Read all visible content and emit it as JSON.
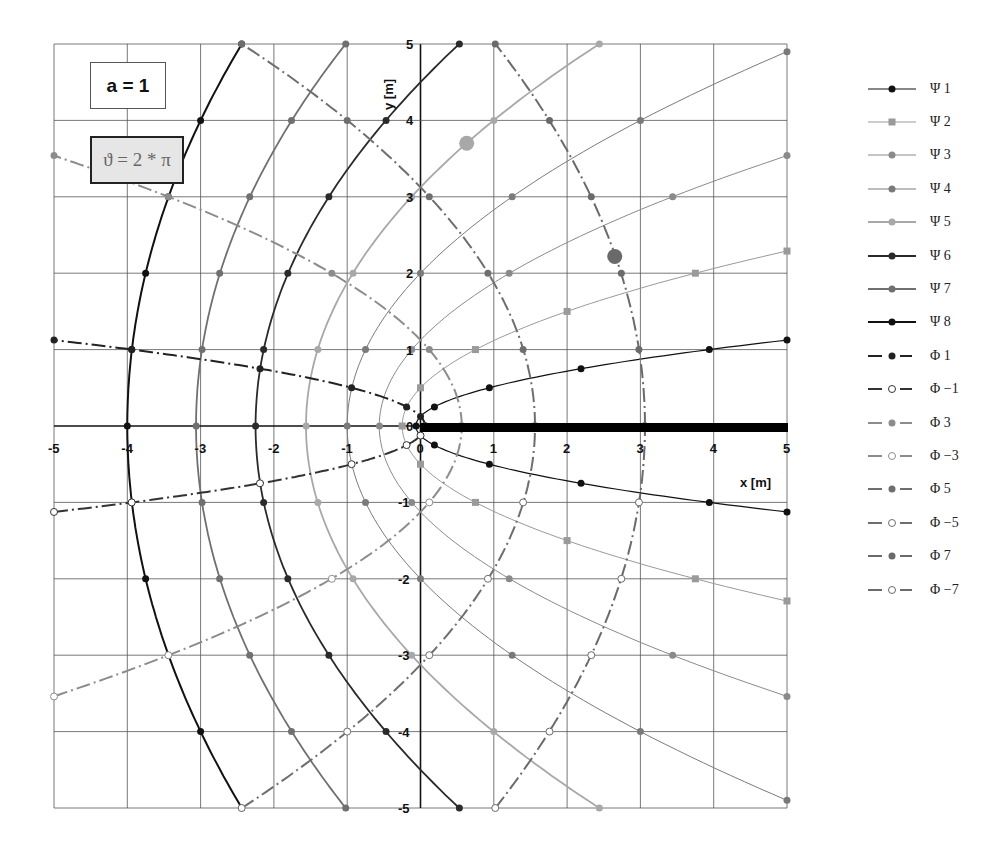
{
  "annotations": {
    "a_label": "a = 1",
    "theta_label": "ϑ = 2 * π"
  },
  "axes": {
    "xlabel": "x [m]",
    "ylabel": "y [m]",
    "x_ticks": [
      "-5",
      "-4",
      "-3",
      "-2",
      "-1",
      "0",
      "1",
      "2",
      "3",
      "4",
      "5"
    ],
    "y_ticks": [
      "5",
      "4",
      "3",
      "2",
      "1",
      "0",
      "-1",
      "-2",
      "-3",
      "-4",
      "-5"
    ]
  },
  "legend": [
    {
      "label": "Ψ 1",
      "color": "#111111",
      "marker": "dot",
      "dash": "solid",
      "width": 1.2
    },
    {
      "label": "Ψ 2",
      "color": "#9a9a9a",
      "marker": "square",
      "dash": "solid",
      "width": 1
    },
    {
      "label": "Ψ 3",
      "color": "#8a8a8a",
      "marker": "dot",
      "dash": "solid",
      "width": 1
    },
    {
      "label": "Ψ 4",
      "color": "#7a7a7a",
      "marker": "dot",
      "dash": "solid",
      "width": 1
    },
    {
      "label": "Ψ 5",
      "color": "#a8a8a8",
      "marker": "dot",
      "dash": "solid",
      "width": 1.8
    },
    {
      "label": "Ψ 6",
      "color": "#2a2a2a",
      "marker": "dot",
      "dash": "solid",
      "width": 1.8
    },
    {
      "label": "Ψ 7",
      "color": "#707070",
      "marker": "dot",
      "dash": "solid",
      "width": 1.8
    },
    {
      "label": "Ψ 8",
      "color": "#111111",
      "marker": "dot",
      "dash": "solid",
      "width": 2
    },
    {
      "label": "Φ 1",
      "color": "#222222",
      "marker": "dot",
      "dash": "dashdot",
      "width": 2
    },
    {
      "label": "Φ −1",
      "color": "#333333",
      "marker": "open",
      "dash": "dashdot",
      "width": 2
    },
    {
      "label": "Φ 3",
      "color": "#8c8c8c",
      "marker": "dot",
      "dash": "dashdot",
      "width": 2
    },
    {
      "label": "Φ −3",
      "color": "#8c8c8c",
      "marker": "open",
      "dash": "dashdot",
      "width": 2
    },
    {
      "label": "Φ 5",
      "color": "#6e6e6e",
      "marker": "dot",
      "dash": "dashdot",
      "width": 2
    },
    {
      "label": "Φ −5",
      "color": "#6e6e6e",
      "marker": "open",
      "dash": "dashdot",
      "width": 2
    },
    {
      "label": "Φ 7",
      "color": "#6a6a6a",
      "marker": "dot",
      "dash": "dashdot",
      "width": 2
    },
    {
      "label": "Φ −7",
      "color": "#6a6a6a",
      "marker": "open",
      "dash": "dashdot",
      "width": 2
    }
  ],
  "chart_data": {
    "type": "line",
    "title": "",
    "xlabel": "x [m]",
    "ylabel": "y [m]",
    "xlim": [
      -5,
      5
    ],
    "ylim": [
      -5,
      5
    ],
    "grid": true,
    "legend_position": "right",
    "annotations": [
      "a = 1",
      "ϑ = 2 * π"
    ],
    "plate": {
      "from": [
        0,
        0
      ],
      "to": [
        5,
        0
      ],
      "note": "thick black segment along positive x-axis"
    },
    "series": [
      {
        "name": "Ψ 1",
        "points": [
          [
            5,
            -1.125
          ],
          [
            3.94,
            -1
          ],
          [
            2.19,
            -0.75
          ],
          [
            0.94,
            -0.5
          ],
          [
            0.19,
            -0.25
          ],
          [
            -0.06,
            0
          ],
          [
            0.19,
            0.25
          ],
          [
            0.94,
            0.5
          ],
          [
            2.19,
            0.75
          ],
          [
            3.94,
            1
          ],
          [
            5,
            1.125
          ]
        ]
      },
      {
        "name": "Ψ 2",
        "points": [
          [
            5,
            -2.29
          ],
          [
            3.75,
            -2
          ],
          [
            2,
            -1.5
          ],
          [
            0.75,
            -1
          ],
          [
            0,
            -0.5
          ],
          [
            -0.25,
            0
          ],
          [
            0,
            0.5
          ],
          [
            0.75,
            1
          ],
          [
            2,
            1.5
          ],
          [
            3.75,
            2
          ],
          [
            5,
            2.29
          ]
        ]
      },
      {
        "name": "Ψ 3",
        "points": [
          [
            5,
            -3.54
          ],
          [
            3.44,
            -3
          ],
          [
            1.21,
            -2
          ],
          [
            -0.12,
            -1
          ],
          [
            -0.56,
            0
          ],
          [
            -0.12,
            1
          ],
          [
            1.21,
            2
          ],
          [
            3.44,
            3
          ],
          [
            5,
            3.54
          ]
        ]
      },
      {
        "name": "Ψ 4",
        "points": [
          [
            5,
            -4.9
          ],
          [
            3,
            -4
          ],
          [
            1.25,
            -3
          ],
          [
            0,
            -2
          ],
          [
            -0.75,
            -1
          ],
          [
            -1,
            0
          ],
          [
            -0.75,
            1
          ],
          [
            0,
            2
          ],
          [
            1.25,
            3
          ],
          [
            3,
            4
          ],
          [
            5,
            4.9
          ]
        ]
      },
      {
        "name": "Ψ 5",
        "points": [
          [
            2.44,
            -5
          ],
          [
            1,
            -4
          ],
          [
            -0.12,
            -3
          ],
          [
            -0.92,
            -2
          ],
          [
            -1.4,
            -1
          ],
          [
            -1.56,
            0
          ],
          [
            -1.4,
            1
          ],
          [
            -0.92,
            2
          ],
          [
            -0.12,
            3
          ],
          [
            1,
            4
          ],
          [
            2.44,
            5
          ]
        ]
      },
      {
        "name": "Ψ 6",
        "points": [
          [
            0.53,
            -5
          ],
          [
            -0.47,
            -4
          ],
          [
            -1.25,
            -3
          ],
          [
            -1.81,
            -2
          ],
          [
            -2.14,
            -1
          ],
          [
            -2.25,
            0
          ],
          [
            -2.14,
            1
          ],
          [
            -1.81,
            2
          ],
          [
            -1.25,
            3
          ],
          [
            -0.47,
            4
          ],
          [
            0.53,
            5
          ]
        ]
      },
      {
        "name": "Ψ 7",
        "points": [
          [
            -1.02,
            -5
          ],
          [
            -1.76,
            -4
          ],
          [
            -2.33,
            -3
          ],
          [
            -2.74,
            -2
          ],
          [
            -2.98,
            -1
          ],
          [
            -3.06,
            0
          ],
          [
            -2.98,
            1
          ],
          [
            -2.74,
            2
          ],
          [
            -2.33,
            3
          ],
          [
            -1.76,
            4
          ],
          [
            -1.02,
            5
          ]
        ]
      },
      {
        "name": "Ψ 8",
        "points": [
          [
            -2.44,
            -5
          ],
          [
            -3,
            -4
          ],
          [
            -3.44,
            -3
          ],
          [
            -3.75,
            -2
          ],
          [
            -3.94,
            -1
          ],
          [
            -4,
            0
          ],
          [
            -3.94,
            1
          ],
          [
            -3.75,
            2
          ],
          [
            -3.44,
            3
          ],
          [
            -3,
            4
          ],
          [
            -2.44,
            5
          ]
        ]
      },
      {
        "name": "Φ 1",
        "points": [
          [
            0.06,
            0
          ],
          [
            0.0,
            0.125
          ],
          [
            -0.19,
            0.25
          ],
          [
            -0.94,
            0.5
          ],
          [
            -2.19,
            0.75
          ],
          [
            -3.94,
            1
          ],
          [
            -5,
            1.125
          ]
        ]
      },
      {
        "name": "Φ −1",
        "points": [
          [
            0.06,
            0
          ],
          [
            0.0,
            -0.125
          ],
          [
            -0.19,
            -0.25
          ],
          [
            -0.94,
            -0.5
          ],
          [
            -2.19,
            -0.75
          ],
          [
            -3.94,
            -1
          ],
          [
            -5,
            -1.125
          ]
        ]
      },
      {
        "name": "Φ 3",
        "points": [
          [
            0.56,
            0
          ],
          [
            0.12,
            1
          ],
          [
            -1.21,
            2
          ],
          [
            -3.44,
            3
          ],
          [
            -5,
            3.54
          ]
        ]
      },
      {
        "name": "Φ −3",
        "points": [
          [
            0.56,
            0
          ],
          [
            0.12,
            -1
          ],
          [
            -1.21,
            -2
          ],
          [
            -3.44,
            -3
          ],
          [
            -5,
            -3.54
          ]
        ]
      },
      {
        "name": "Φ 5",
        "points": [
          [
            1.56,
            0
          ],
          [
            1.4,
            1
          ],
          [
            0.92,
            2
          ],
          [
            0.12,
            3
          ],
          [
            -1,
            4
          ],
          [
            -2.44,
            5
          ]
        ]
      },
      {
        "name": "Φ −5",
        "points": [
          [
            1.56,
            0
          ],
          [
            1.4,
            -1
          ],
          [
            0.92,
            -2
          ],
          [
            0.12,
            -3
          ],
          [
            -1,
            -4
          ],
          [
            -2.44,
            -5
          ]
        ]
      },
      {
        "name": "Φ 7",
        "points": [
          [
            3.06,
            0
          ],
          [
            2.98,
            1
          ],
          [
            2.74,
            2
          ],
          [
            2.33,
            3
          ],
          [
            1.76,
            4
          ],
          [
            1.02,
            5
          ]
        ]
      },
      {
        "name": "Φ −7",
        "points": [
          [
            3.06,
            0
          ],
          [
            2.98,
            -1
          ],
          [
            2.74,
            -2
          ],
          [
            2.33,
            -3
          ],
          [
            1.76,
            -4
          ],
          [
            1.02,
            -5
          ]
        ]
      }
    ],
    "highlight_points": [
      {
        "series": "Ψ 5",
        "x": 0.63,
        "y": 3.7
      },
      {
        "series": "Φ 7",
        "x": 2.65,
        "y": 2.22
      }
    ]
  }
}
